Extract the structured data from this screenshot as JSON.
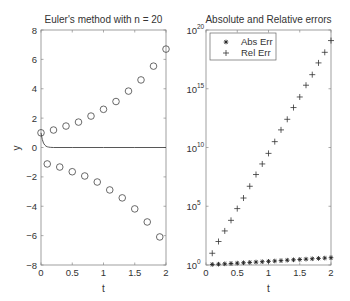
{
  "chart_data": [
    {
      "type": "scatter",
      "title": "Euler's method with n = 20",
      "xlabel": "t",
      "ylabel": "y",
      "xlim": [
        0,
        2
      ],
      "ylim": [
        -8,
        8
      ],
      "xticks": [
        0,
        0.5,
        1,
        1.5,
        2
      ],
      "xtick_labels": [
        "0",
        "0.5",
        "1",
        "1.5",
        "2"
      ],
      "yticks": [
        -8,
        -6,
        -4,
        -2,
        0,
        2,
        4,
        6,
        8
      ],
      "ytick_labels": [
        "−8",
        "−6",
        "−4",
        "−2",
        "0",
        "2",
        "4",
        "6",
        "8"
      ],
      "grid": false,
      "series": [
        {
          "name": "Euler approximation",
          "marker": "circle",
          "x": [
            0,
            0.1,
            0.2,
            0.3,
            0.4,
            0.5,
            0.6,
            0.7,
            0.8,
            0.9,
            1.0,
            1.1,
            1.2,
            1.3,
            1.4,
            1.5,
            1.6,
            1.7,
            1.8,
            1.9,
            2.0
          ],
          "y": [
            1,
            -1.12,
            1.19,
            -1.33,
            1.46,
            -1.65,
            1.73,
            -1.94,
            2.14,
            -2.35,
            2.6,
            -2.89,
            3.13,
            -3.43,
            3.84,
            -4.18,
            4.6,
            -5.07,
            5.54,
            -6.09,
            6.7
          ]
        },
        {
          "name": "Exact solution",
          "marker": "line",
          "x": [
            0,
            0.02,
            0.04,
            0.06,
            0.08,
            0.1,
            0.12,
            0.15,
            0.2,
            0.5,
            1.0,
            1.5,
            2.0
          ],
          "y": [
            1,
            0.55,
            0.3,
            0.17,
            0.09,
            0.05,
            0.03,
            0.01,
            0.0,
            0.0,
            0.0,
            0.0,
            0.0
          ]
        }
      ]
    },
    {
      "type": "scatter",
      "title": "Absolute and Relative errors",
      "xlabel": "t",
      "ylabel": "",
      "yscale": "log",
      "xlim": [
        0,
        2
      ],
      "ylim": [
        1,
        1e+20
      ],
      "xticks": [
        0,
        0.5,
        1,
        1.5,
        2
      ],
      "xtick_labels": [
        "0",
        "0.5",
        "1",
        "1.5",
        "2"
      ],
      "yticks_exp": [
        0,
        5,
        10,
        15,
        20
      ],
      "ytick_base": "10",
      "grid": false,
      "legend": {
        "position": "upper left",
        "entries": [
          "Abs Err",
          "Rel Err"
        ]
      },
      "series": [
        {
          "name": "Abs Err",
          "marker": "asterisk",
          "x": [
            0.1,
            0.2,
            0.3,
            0.4,
            0.5,
            0.6,
            0.7,
            0.8,
            0.9,
            1.0,
            1.1,
            1.2,
            1.3,
            1.4,
            1.5,
            1.6,
            1.7,
            1.8,
            1.9,
            2.0
          ],
          "log10_y": [
            0.05,
            0.07,
            0.1,
            0.13,
            0.16,
            0.19,
            0.22,
            0.25,
            0.28,
            0.31,
            0.34,
            0.37,
            0.41,
            0.44,
            0.47,
            0.5,
            0.53,
            0.56,
            0.59,
            0.62
          ]
        },
        {
          "name": "Rel Err",
          "marker": "plus",
          "x": [
            0.1,
            0.2,
            0.3,
            0.4,
            0.5,
            0.6,
            0.7,
            0.8,
            0.9,
            1.0,
            1.1,
            1.2,
            1.3,
            1.4,
            1.5,
            1.6,
            1.7,
            1.8,
            1.9,
            2.0
          ],
          "log10_y": [
            1.0,
            2.0,
            2.9,
            3.8,
            4.8,
            5.7,
            6.7,
            7.7,
            8.6,
            9.5,
            10.5,
            11.5,
            12.4,
            13.4,
            14.3,
            15.3,
            16.2,
            17.2,
            18.1,
            19.1
          ]
        }
      ]
    }
  ]
}
